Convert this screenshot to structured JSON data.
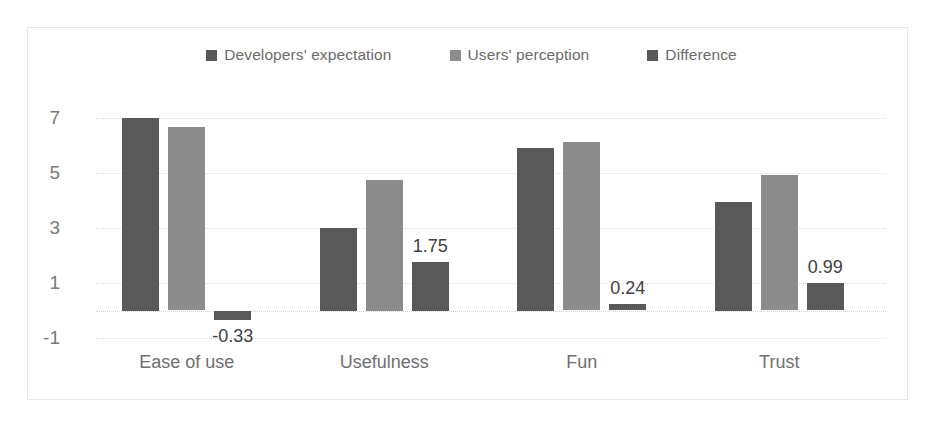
{
  "chart_data": {
    "type": "bar",
    "title": "",
    "subtitle": "",
    "xlabel": "",
    "ylabel": "",
    "categories": [
      "Ease of use",
      "Usefulness",
      "Fun",
      "Trust"
    ],
    "series": [
      {
        "name": "Developers' expectation",
        "color": "#595959",
        "values": [
          7.0,
          3.0,
          5.9,
          3.95
        ],
        "show_labels": false
      },
      {
        "name": "Users' perception",
        "color": "#8c8c8c",
        "values": [
          6.67,
          4.75,
          6.14,
          4.94
        ],
        "show_labels": false
      },
      {
        "name": "Difference",
        "color": "#595959",
        "values": [
          -0.33,
          1.75,
          0.24,
          0.99
        ],
        "labels": [
          "-0.33",
          "1.75",
          "0.24",
          "0.99"
        ],
        "show_labels": true
      }
    ],
    "ylim": [
      -1,
      7
    ],
    "yticks": [
      7,
      5,
      3,
      1,
      -1
    ],
    "ytick_labels": [
      "7",
      "5",
      "3",
      "1",
      "-1"
    ],
    "gridlines": [
      7,
      5,
      3,
      1,
      0,
      -1
    ],
    "grid": true,
    "grid_style": "dotted",
    "legend_position": "top-center",
    "axis_line": false,
    "frame_color": "#e8e8e8",
    "background": "#ffffff"
  },
  "legend": {
    "items": [
      {
        "label": "Developers' expectation",
        "color": "#595959"
      },
      {
        "label": "Users' perception",
        "color": "#8c8c8c"
      },
      {
        "label": "Difference",
        "color": "#595959"
      }
    ]
  }
}
